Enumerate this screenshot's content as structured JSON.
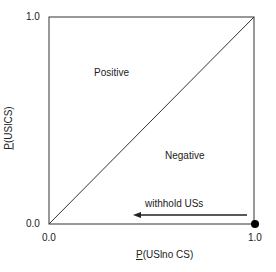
{
  "diagram": {
    "region_labels": {
      "upper": "Positive",
      "lower": "Negative"
    },
    "arrow_label": "withhold USs",
    "axes": {
      "x": {
        "prefix": "P",
        "rest": "(USlno CS)",
        "ticks": [
          "0.0",
          "1.0"
        ]
      },
      "y": {
        "prefix": "P",
        "rest": "(USlCS)",
        "ticks": [
          "0.0",
          "1.0"
        ]
      }
    },
    "colors": {
      "line": "#333333",
      "dot": "#000000"
    }
  }
}
